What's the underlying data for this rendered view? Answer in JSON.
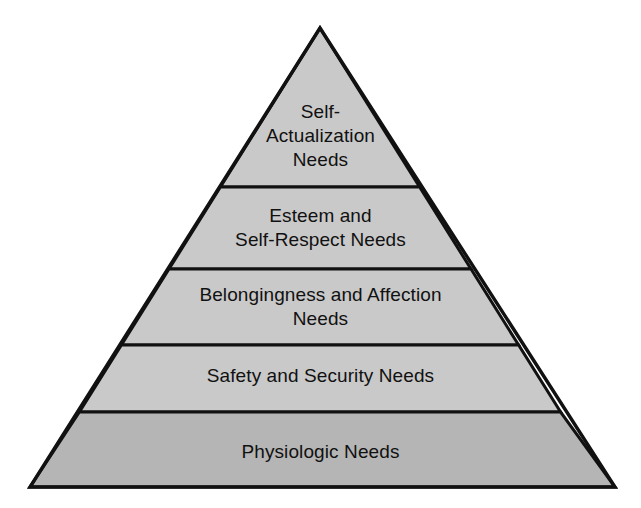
{
  "diagram": {
    "type": "pyramid",
    "background_color": "#ffffff",
    "stroke_color": "#111111",
    "stroke_width": 3,
    "apex": {
      "x": 320,
      "y": 28
    },
    "base_left": {
      "x": 30,
      "y": 487
    },
    "base_right": {
      "x": 615,
      "y": 487
    },
    "divider_y": [
      187,
      269,
      345,
      412
    ],
    "tiers": [
      {
        "rank": 1,
        "position": "top",
        "label": "Self-\nActualization\nNeeds",
        "label_plain": "Self-Actualization Needs",
        "fill_color": "#c9c9c9",
        "top_y": 28,
        "bottom_y": 187
      },
      {
        "rank": 2,
        "position": "second",
        "label": "Esteem and\nSelf-Respect Needs",
        "label_plain": "Esteem and Self-Respect Needs",
        "fill_color": "#c9c9c9",
        "top_y": 187,
        "bottom_y": 269
      },
      {
        "rank": 3,
        "position": "middle",
        "label": "Belongingness and Affection\nNeeds",
        "label_plain": "Belongingness and Affection Needs",
        "fill_color": "#c9c9c9",
        "top_y": 269,
        "bottom_y": 345
      },
      {
        "rank": 4,
        "position": "fourth",
        "label": "Safety and Security Needs",
        "label_plain": "Safety and Security Needs",
        "fill_color": "#c9c9c9",
        "top_y": 345,
        "bottom_y": 412
      },
      {
        "rank": 5,
        "position": "base",
        "label": "Physiologic Needs",
        "label_plain": "Physiologic Needs",
        "fill_color": "#b5b5b5",
        "top_y": 412,
        "bottom_y": 487
      }
    ]
  }
}
